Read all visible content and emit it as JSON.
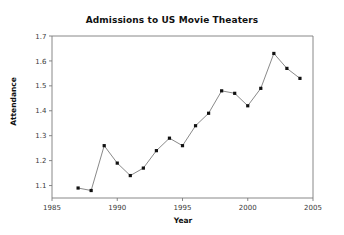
{
  "chart_data": {
    "type": "line",
    "title": "Admissions to US Movie Theaters",
    "xlabel": "Year",
    "ylabel": "Attendance",
    "x": [
      1987,
      1988,
      1989,
      1990,
      1991,
      1992,
      1993,
      1994,
      1995,
      1996,
      1997,
      1998,
      1999,
      2000,
      2001,
      2002,
      2003,
      2004
    ],
    "values": [
      1.09,
      1.08,
      1.26,
      1.19,
      1.14,
      1.17,
      1.24,
      1.29,
      1.26,
      1.34,
      1.39,
      1.48,
      1.47,
      1.42,
      1.49,
      1.63,
      1.57,
      1.53
    ],
    "xlim": [
      1985,
      2005
    ],
    "ylim": [
      1.05,
      1.7
    ],
    "xticks": [
      1985,
      1990,
      1995,
      2000,
      2005
    ],
    "xtick_labels": [
      "1985",
      "1990",
      "1995",
      "2000",
      "2005"
    ],
    "yticks": [
      1.1,
      1.2,
      1.3,
      1.4,
      1.5,
      1.6,
      1.7
    ],
    "ytick_labels": [
      "1.1",
      "1.2",
      "1.3",
      "1.4",
      "1.5",
      "1.6",
      "1.7"
    ],
    "grid": false,
    "legend": null,
    "marker": "square",
    "marker_color": "#111111",
    "line_color": "#6b6b6b",
    "axis_color": "#7a7a7a",
    "background_color": "#ffffff"
  }
}
